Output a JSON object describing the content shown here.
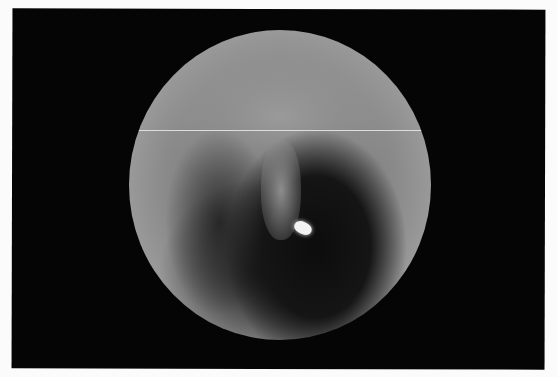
{
  "image": {
    "description": "Grayscale circular endoscopic/otoscopic view on black background",
    "colors": {
      "background": "#fbfbfb",
      "frame": "#050505",
      "glare": "#f2f2f2"
    }
  }
}
